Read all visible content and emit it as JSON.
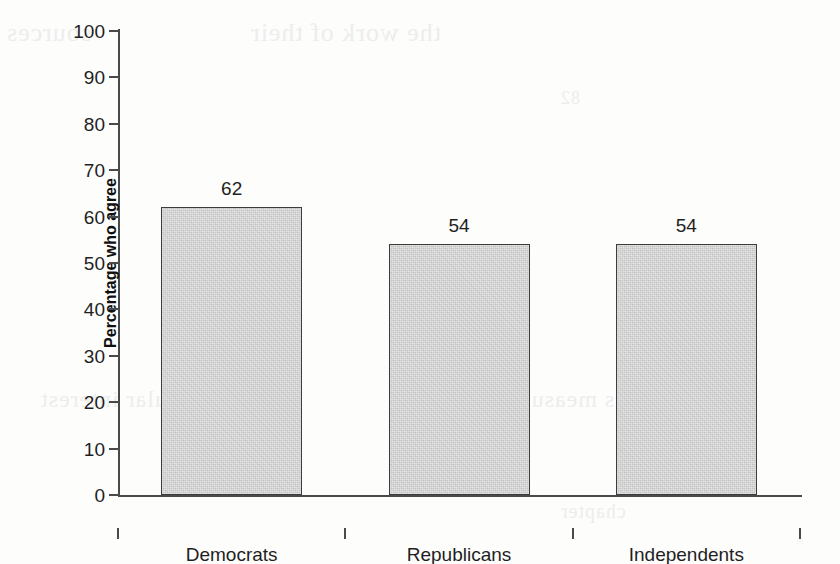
{
  "chart_data": {
    "type": "bar",
    "title": "",
    "subtitle": "",
    "xlabel": "",
    "ylabel": "Percentage who agree",
    "categories": [
      "Democrats",
      "Republicans",
      "Independents"
    ],
    "values": [
      62,
      54,
      54
    ],
    "data_labels": [
      "62",
      "54",
      "54"
    ],
    "ylim": [
      0,
      100
    ],
    "ytick_values": [
      0,
      10,
      20,
      30,
      40,
      50,
      60,
      70,
      80,
      90,
      100
    ],
    "ytick_labels": [
      "0",
      "10",
      "20",
      "30",
      "40",
      "50",
      "60",
      "70",
      "80",
      "90",
      "100"
    ],
    "grid": false,
    "legend": false,
    "legend_position": "none",
    "bar_fill_color": "#c9c9c9",
    "bar_border_color": "#3c3c3c",
    "axis_color": "#4a4a4a",
    "background_color": "#fdfdfc",
    "text_color": "#1f1f1f"
  },
  "ghost_text": {
    "line1": "sources",
    "line2": "the work of their",
    "line3": "particular interest",
    "line4": "as measured in the",
    "line5": "82",
    "line6": "chapter"
  }
}
